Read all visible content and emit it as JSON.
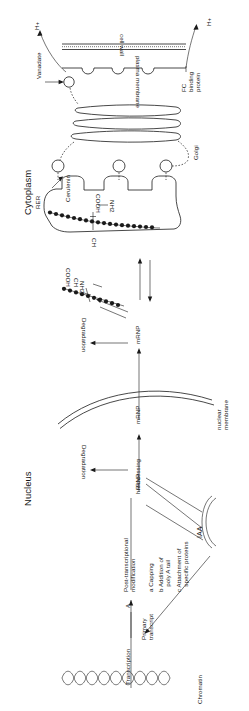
{
  "diagram": {
    "orientation": "rotated-90",
    "compartments": [
      {
        "id": "cytoplasm",
        "label": "Cytoplasm"
      },
      {
        "id": "nucleus",
        "label": "Nucleus"
      }
    ],
    "structures": [
      {
        "id": "cell-wall",
        "label": "cell wall"
      },
      {
        "id": "plasma-membrane",
        "label": "plasma membrane"
      },
      {
        "id": "golgi",
        "label": "Golgi"
      },
      {
        "id": "rer",
        "label": "RER"
      },
      {
        "id": "nuclear-membrane",
        "label": "nuclear\nmembrane"
      },
      {
        "id": "chromatin",
        "label": "Chromatin"
      }
    ],
    "molecules": [
      {
        "id": "proton-top",
        "label": "H+"
      },
      {
        "id": "proton-bottom",
        "label": "H+"
      },
      {
        "id": "vanadate",
        "label": "Vanadate"
      },
      {
        "id": "fc-binding-protein",
        "label": "FC\nbinding\nprotein"
      },
      {
        "id": "cerulenin",
        "label": "Cerulenin"
      },
      {
        "id": "iaa",
        "label": "IAA"
      }
    ],
    "chain_labels": {
      "cooh": "COOH",
      "nh2": "NH2",
      "ch": "CH"
    },
    "rna_species": [
      {
        "id": "hnrnp",
        "label": "hnRNP"
      },
      {
        "id": "mrnp-nuclear",
        "label": "mRNP"
      },
      {
        "id": "mrnp-cytoplasm",
        "label": "mRNP"
      },
      {
        "id": "primary-transcript",
        "label": "Primary\ntranscript"
      }
    ],
    "processes": [
      {
        "id": "transcription",
        "label": "Transcription"
      },
      {
        "id": "transcription-step",
        "label": "A"
      },
      {
        "id": "post-transcriptional",
        "label": "Post-transcriptional\nmodification"
      },
      {
        "id": "processing",
        "label": "Processing"
      },
      {
        "id": "degradation-nuclear",
        "label": "Degradation"
      },
      {
        "id": "degradation-cytoplasm",
        "label": "Degradation"
      }
    ],
    "modification_steps": [
      {
        "key": "a",
        "label": "a Capping"
      },
      {
        "key": "b",
        "label": "b Addition of\n   poly A tail"
      },
      {
        "key": "c",
        "label": "c Attachment of\n   specific proteins"
      }
    ],
    "colors": {
      "ink": "#1a1a1a",
      "background": "#ffffff"
    }
  }
}
